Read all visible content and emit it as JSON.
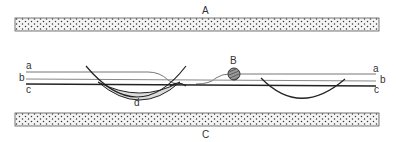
{
  "diagram": {
    "labels": {
      "top_bar": "A",
      "bead": "B",
      "bottom_bar": "C",
      "crescent": "d",
      "line_a_left": "a",
      "line_b_left": "b",
      "line_c_left": "c",
      "line_a_right": "a",
      "line_b_right": "b",
      "line_c_right": "c"
    },
    "colors": {
      "ink": "#222222",
      "stipple_fill": "#e8e8e8",
      "crescent_fill": "#dddddd"
    }
  }
}
